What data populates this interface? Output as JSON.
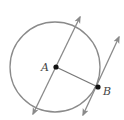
{
  "diagram": {
    "type": "geometry",
    "colors": {
      "stroke": "#8a8a8a",
      "point": "#111111",
      "label": "#444444",
      "background": "#ffffff"
    },
    "circle": {
      "center": "A",
      "cx": 55,
      "cy": 67,
      "r": 45
    },
    "points": [
      {
        "name": "A",
        "label": "A",
        "x": 56,
        "y": 67
      },
      {
        "name": "B",
        "label": "B",
        "x": 98,
        "y": 87
      }
    ],
    "segments": [
      {
        "name": "radius-AB",
        "from": "A",
        "to": "B"
      }
    ],
    "lines": [
      {
        "name": "line-through-A",
        "x1": 33,
        "y1": 114,
        "x2": 80,
        "y2": 17,
        "arrows": "both"
      },
      {
        "name": "tangent-at-B",
        "x1": 83,
        "y1": 115,
        "x2": 119,
        "y2": 37,
        "arrows": "both"
      }
    ]
  }
}
